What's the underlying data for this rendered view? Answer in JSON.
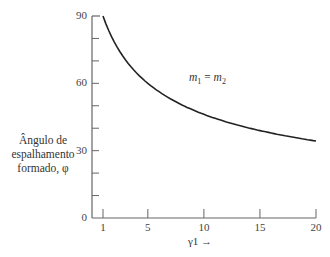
{
  "chart_data": {
    "type": "line",
    "title": "",
    "xlabel": "γ1 →",
    "ylabel": "Ângulo de espalhamento formado, φ",
    "ylabel_lines": [
      "Ângulo de",
      "espalhamento",
      "formado, φ"
    ],
    "xlim": [
      1,
      20
    ],
    "ylim": [
      0,
      90
    ],
    "x_ticks": [
      1,
      5,
      10,
      15,
      20
    ],
    "y_ticks": [
      0,
      30,
      60,
      90
    ],
    "y_minor_ticks": [
      10,
      20,
      40,
      50,
      70,
      80
    ],
    "grid": false,
    "annotation": {
      "text": "m1 = m2",
      "lhs": "m",
      "lhs_sub": "1",
      "eq": " = ",
      "rhs": "m",
      "rhs_sub": "2"
    },
    "series": [
      {
        "name": "m1 = m2",
        "x": [
          1,
          1.5,
          2,
          3,
          4,
          5,
          6,
          7,
          8,
          10,
          12,
          15,
          18,
          20
        ],
        "y": [
          90,
          81.8,
          78.5,
          70.5,
          64.6,
          60.0,
          56.3,
          53.1,
          50.5,
          46.2,
          42.8,
          38.9,
          35.9,
          34.3
        ]
      }
    ]
  }
}
